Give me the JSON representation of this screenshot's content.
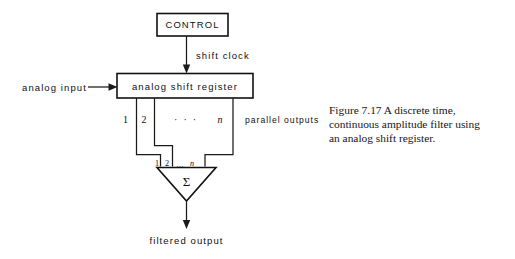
{
  "figure": {
    "domain": "Diagram",
    "caption": {
      "lines": [
        "Figure 7.17  A discrete time,",
        "continuous amplitude filter using",
        "an analog shift register."
      ],
      "full_text": "Figure 7.17 A discrete time, continuous amplitude filter using an analog shift register.",
      "figure_number": "7.17"
    },
    "blocks": {
      "control": {
        "label": "CONTROL"
      },
      "shift_register": {
        "label": "analog  shift  register"
      },
      "summer": {
        "symbol": "Σ"
      }
    },
    "signals": {
      "shift_clock": "shift  clock",
      "analog_input": "analog  input",
      "parallel_outputs": "parallel  outputs",
      "filtered_output": "filtered  output"
    },
    "taps": {
      "register_side": {
        "first": "1",
        "second": "2",
        "ellipsis": "· · ·",
        "last": "n"
      },
      "summer_side": {
        "first": "1",
        "second": "2",
        "ellipsis": "...",
        "last": "n"
      }
    },
    "colors": {
      "ink": "#111111",
      "paper": "#ffffff"
    }
  }
}
